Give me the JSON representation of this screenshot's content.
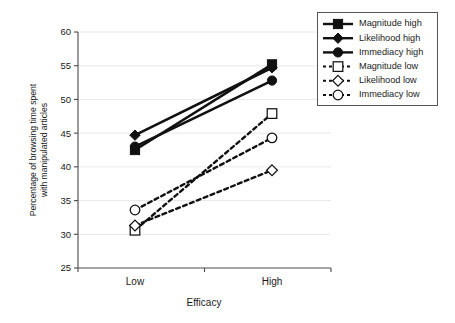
{
  "chart_data": {
    "type": "line",
    "title": "",
    "xlabel": "Efficacy",
    "ylabel_line1": "Percentage of browsing time spent",
    "ylabel_line2": "with manipulated articles",
    "categories": [
      "Low",
      "High"
    ],
    "ylim": [
      25,
      60
    ],
    "yticks": [
      25,
      30,
      35,
      40,
      45,
      50,
      55,
      60
    ],
    "ytick_labels": [
      "25",
      "30",
      "35",
      "40",
      "45",
      "50",
      "55",
      "60"
    ],
    "grid": true,
    "legend_position": "top-right",
    "series": [
      {
        "name": "Magnitude high",
        "values": [
          42.5,
          55.2
        ],
        "marker": "square",
        "marker_fill": "filled",
        "line_style": "solid",
        "color": "#111111"
      },
      {
        "name": "Likelihood high",
        "values": [
          44.7,
          54.7
        ],
        "marker": "diamond",
        "marker_fill": "filled",
        "line_style": "solid",
        "color": "#111111"
      },
      {
        "name": "Immediacy high",
        "values": [
          43.0,
          52.8
        ],
        "marker": "circle",
        "marker_fill": "filled",
        "line_style": "solid",
        "color": "#111111"
      },
      {
        "name": "Magnitude low",
        "values": [
          30.6,
          47.9
        ],
        "marker": "square",
        "marker_fill": "open",
        "line_style": "dashed",
        "color": "#111111"
      },
      {
        "name": "Likelihood low",
        "values": [
          31.3,
          39.5
        ],
        "marker": "diamond",
        "marker_fill": "open",
        "line_style": "dashed",
        "color": "#111111"
      },
      {
        "name": "Immediacy low",
        "values": [
          33.6,
          44.3
        ],
        "marker": "circle",
        "marker_fill": "open",
        "line_style": "dashed",
        "color": "#111111"
      }
    ]
  }
}
